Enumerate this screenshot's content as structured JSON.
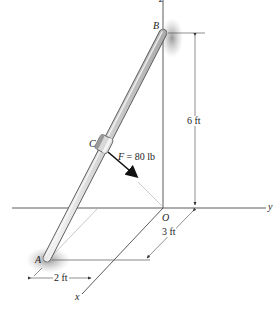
{
  "diagram": {
    "type": "3d-statics-figure",
    "points": {
      "A": "A",
      "B": "B",
      "C": "C",
      "O": "O"
    },
    "axes": {
      "x": "x",
      "y": "y",
      "z": "z"
    },
    "force": {
      "symbol": "F",
      "equals": "=",
      "value": "80 lb",
      "label": "F = 80 lb"
    },
    "dimensions": {
      "height": "6 ft",
      "depth": "3 ft",
      "offset": "2 ft"
    },
    "colors": {
      "rod_light": "#e8e8e8",
      "rod_dark": "#7a7a7a",
      "axis": "#333333",
      "guide": "#b0b0b0",
      "shadow": "#9a9a9a",
      "arrow": "#111111"
    }
  }
}
